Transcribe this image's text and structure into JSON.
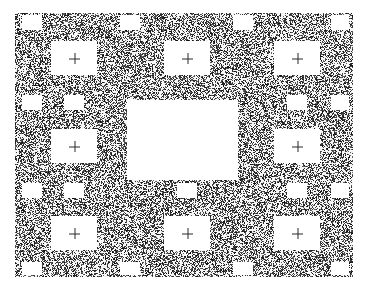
{
  "image": {
    "kind": "visual-psychophysics-stimulus",
    "width": 370,
    "height": 288,
    "background_color": "#ffffff"
  },
  "noise_field": {
    "name": "binary-speckle-noise",
    "x": 15,
    "y": 13,
    "width": 338,
    "height": 264,
    "ink_color": "#1a1a1a",
    "paper_color": "#ffffff",
    "density": 0.46,
    "cell_size": 1,
    "seed": 20250614
  },
  "grid": {
    "columns_x": [
      74,
      187,
      297
    ],
    "rows_y": [
      58,
      146,
      233
    ],
    "major_cell": {
      "width": 46,
      "height": 34
    },
    "minor_cell": {
      "width": 20,
      "height": 15
    },
    "minor_columns_x": [
      32,
      130,
      243,
      340
    ],
    "minor_rows_y": [
      22,
      102,
      190,
      268
    ]
  },
  "target_rect": {
    "label": "central-blank-target",
    "x": 127,
    "y": 100,
    "width": 111,
    "height": 80,
    "fill": "#ffffff",
    "has_cross": false
  },
  "apertures": [
    {
      "id": "cell-top-left",
      "cx": 74,
      "cy": 58,
      "w": 46,
      "h": 34,
      "cross": true
    },
    {
      "id": "cell-top-center",
      "cx": 187,
      "cy": 58,
      "w": 46,
      "h": 34,
      "cross": true
    },
    {
      "id": "cell-top-right",
      "cx": 297,
      "cy": 58,
      "w": 46,
      "h": 34,
      "cross": true
    },
    {
      "id": "cell-middle-left",
      "cx": 74,
      "cy": 146,
      "w": 46,
      "h": 34,
      "cross": true
    },
    {
      "id": "cell-middle-right",
      "cx": 297,
      "cy": 146,
      "w": 46,
      "h": 34,
      "cross": true
    },
    {
      "id": "cell-bottom-left",
      "cx": 74,
      "cy": 233,
      "w": 46,
      "h": 34,
      "cross": true
    },
    {
      "id": "cell-bottom-center",
      "cx": 187,
      "cy": 233,
      "w": 46,
      "h": 34,
      "cross": true
    },
    {
      "id": "cell-bottom-right",
      "cx": 297,
      "cy": 233,
      "w": 46,
      "h": 34,
      "cross": true
    },
    {
      "id": "minor-r0-c0",
      "cx": 32,
      "cy": 22,
      "w": 20,
      "h": 15,
      "cross": false
    },
    {
      "id": "minor-r0-c1",
      "cx": 130,
      "cy": 22,
      "w": 20,
      "h": 15,
      "cross": false
    },
    {
      "id": "minor-r0-c2",
      "cx": 243,
      "cy": 22,
      "w": 20,
      "h": 15,
      "cross": false
    },
    {
      "id": "minor-r0-c3",
      "cx": 340,
      "cy": 22,
      "w": 18,
      "h": 15,
      "cross": false
    },
    {
      "id": "minor-r1-c0",
      "cx": 32,
      "cy": 102,
      "w": 20,
      "h": 15,
      "cross": false
    },
    {
      "id": "minor-r1-c1",
      "cx": 74,
      "cy": 102,
      "w": 20,
      "h": 15,
      "cross": false
    },
    {
      "id": "minor-r1-c3",
      "cx": 297,
      "cy": 102,
      "w": 20,
      "h": 15,
      "cross": false
    },
    {
      "id": "minor-r1-c4",
      "cx": 340,
      "cy": 102,
      "w": 18,
      "h": 15,
      "cross": false
    },
    {
      "id": "minor-r2-c0",
      "cx": 32,
      "cy": 190,
      "w": 20,
      "h": 15,
      "cross": false
    },
    {
      "id": "minor-r2-c1",
      "cx": 74,
      "cy": 190,
      "w": 20,
      "h": 15,
      "cross": false
    },
    {
      "id": "minor-r2-c2",
      "cx": 187,
      "cy": 190,
      "w": 20,
      "h": 15,
      "cross": false
    },
    {
      "id": "minor-r2-c3",
      "cx": 297,
      "cy": 190,
      "w": 20,
      "h": 15,
      "cross": false
    },
    {
      "id": "minor-r2-c4",
      "cx": 340,
      "cy": 190,
      "w": 18,
      "h": 15,
      "cross": false
    },
    {
      "id": "minor-r3-c0",
      "cx": 32,
      "cy": 268,
      "w": 20,
      "h": 13,
      "cross": false
    },
    {
      "id": "minor-r3-c1",
      "cx": 130,
      "cy": 268,
      "w": 20,
      "h": 13,
      "cross": false
    },
    {
      "id": "minor-r3-c2",
      "cx": 243,
      "cy": 268,
      "w": 20,
      "h": 13,
      "cross": false
    },
    {
      "id": "minor-r3-c3",
      "cx": 340,
      "cy": 268,
      "w": 18,
      "h": 13,
      "cross": false
    }
  ],
  "fixation_cross": {
    "glyph": "plus",
    "size": 11,
    "stroke": 1,
    "color": "#2b2b2b"
  }
}
